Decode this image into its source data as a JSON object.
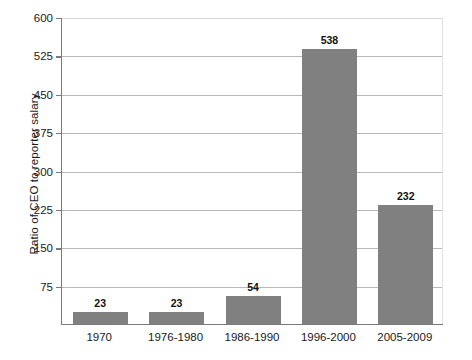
{
  "chart_data": {
    "type": "bar",
    "title": "",
    "xlabel": "",
    "ylabel": "Ratio of CEO to reporter salary",
    "categories": [
      "1970",
      "1976-1980",
      "1986-1990",
      "1996-2000",
      "2005-2009"
    ],
    "values": [
      23,
      23,
      54,
      538,
      232
    ],
    "value_labels": [
      "23",
      "23",
      "54",
      "538",
      "232"
    ],
    "ylim": [
      0,
      600
    ],
    "yticks": [
      75,
      150,
      225,
      300,
      375,
      450,
      525,
      600
    ],
    "ytick_labels": [
      "75",
      "150",
      "225",
      "300",
      "375",
      "450",
      "525",
      "600"
    ],
    "grid": true,
    "legend": false,
    "bar_color": "#808080",
    "gridline_color": "#b9b9b9",
    "axis_color": "#7a7a7a",
    "background": "#ffffff"
  }
}
